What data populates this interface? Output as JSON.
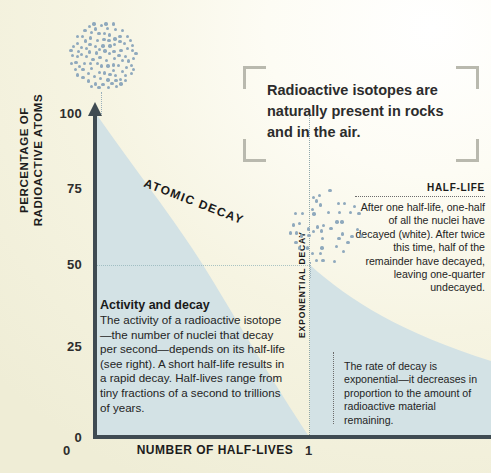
{
  "chart_data": {
    "type": "area",
    "title": "Atomic decay",
    "xlabel": "NUMBER OF HALF-LIVES",
    "ylabel": "PERCENTAGE OF RADIOACTIVE ATOMS",
    "xlim": [
      0,
      2.9
    ],
    "ylim": [
      0,
      100
    ],
    "x_ticks": [
      "0",
      "1"
    ],
    "y_ticks": [
      "0",
      "25",
      "50",
      "75",
      "100"
    ],
    "grid": "dotted gridline at y=50 and vertical dotted line at x=1",
    "legend": "none",
    "series": [
      {
        "name": "Percentage of radioactive atoms remaining",
        "x": [
          0,
          0.25,
          0.5,
          0.75,
          1,
          1.25,
          1.5,
          1.75,
          2,
          2.5,
          2.9
        ],
        "values": [
          100,
          84,
          70.7,
          59.5,
          50,
          42,
          35.4,
          29.7,
          25,
          17.7,
          13.4
        ]
      }
    ],
    "annotations": [
      {
        "label": "ATOMIC DECAY",
        "position": "along curve, rotated"
      },
      {
        "label": "EXPONENTIAL DECAY",
        "position": "vertical at x=1"
      }
    ],
    "curve_color": "#d3e2e5",
    "axis_color": "#3f4b52"
  },
  "axes": {
    "y_title": "PERCENTAGE OF RADIOACTIVE ATOMS",
    "x_title": "NUMBER OF HALF-LIVES",
    "y_ticks": [
      "100",
      "75",
      "50",
      "25",
      "0"
    ],
    "x_tick_zero": "0",
    "x_tick_one": "1"
  },
  "curve_labels": {
    "atomic_decay": "ATOMIC DECAY",
    "exponential_decay": "EXPONENTIAL DECAY"
  },
  "quote": {
    "text": "Radioactive isotopes are naturally present in rocks and in the air."
  },
  "activity": {
    "heading": "Activity and decay",
    "body": "The activity of a radioactive isotope—the number of nuclei that decay per second—depends on its half-life (see right). A short half-life results in a rapid decay. Half-lives range from tiny fractions of a second to trillions of years."
  },
  "halflife": {
    "heading": "HALF-LIFE",
    "body": "After one half-life, one-half of all the nuclei have decayed (white). After twice this time, half of the remainder have decayed, leaving one-quarter undecayed."
  },
  "exponential": {
    "body": "The rate of decay is exponential—it decreases in proportion to the amount of radioactive material remaining."
  },
  "colors": {
    "paper": "#f2f0dc",
    "fill": "#d3e2e5",
    "axis": "#3f4b52",
    "atom": "#8fa9bd",
    "bracket": "#b9b9ae"
  }
}
